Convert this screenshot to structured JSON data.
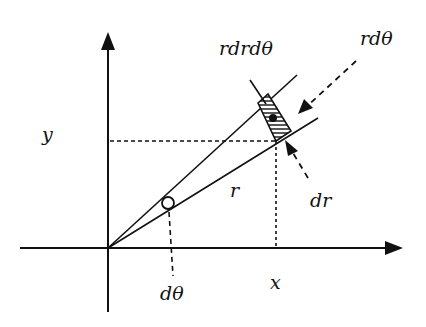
{
  "diagram": {
    "labels": {
      "y_axis": "y",
      "x_axis": "x",
      "radius": "r",
      "area_element": "rdrdθ",
      "arc_length": "rdθ",
      "radial_increment": "dr",
      "angle_increment": "dθ"
    },
    "colors": {
      "stroke": "#111111",
      "background": "#ffffff"
    },
    "geometry": {
      "origin": [
        108,
        248
      ],
      "x_axis_end": [
        402,
        248
      ],
      "y_axis_top": [
        108,
        33
      ],
      "y_axis_bottom": [
        108,
        312
      ],
      "upper_ray_end": [
        297,
        75
      ],
      "lower_ray_end": [
        318,
        118
      ],
      "point": [
        276,
        141
      ],
      "angle_marker_center": [
        168,
        203
      ]
    }
  }
}
